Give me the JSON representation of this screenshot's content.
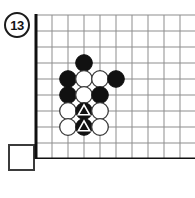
{
  "figure": {
    "kind": "go-board-diagram",
    "label": {
      "text": "13",
      "shape": "circle"
    },
    "answer_box": {
      "text": "",
      "shape": "square",
      "state": "empty"
    }
  },
  "board": {
    "columns": 10,
    "rows": 9,
    "cell_size": 16,
    "edges": [
      "left",
      "bottom"
    ],
    "grid_color": "#8d8d8d",
    "edge_color": "#101010",
    "black_color": "#111111",
    "white_color": "#ffffff",
    "marker_color": "#ffffff"
  },
  "stones": [
    {
      "id": "b1",
      "color": "black",
      "col": 3,
      "row": 3,
      "marker": "none"
    },
    {
      "id": "b2",
      "color": "black",
      "col": 2,
      "row": 4,
      "marker": "none"
    },
    {
      "id": "w1",
      "color": "white",
      "col": 3,
      "row": 4,
      "marker": "none"
    },
    {
      "id": "w2",
      "color": "white",
      "col": 4,
      "row": 4,
      "marker": "none"
    },
    {
      "id": "b3",
      "color": "black",
      "col": 5,
      "row": 4,
      "marker": "none"
    },
    {
      "id": "b4",
      "color": "black",
      "col": 2,
      "row": 5,
      "marker": "none"
    },
    {
      "id": "w3",
      "color": "white",
      "col": 3,
      "row": 5,
      "marker": "none"
    },
    {
      "id": "b5",
      "color": "black",
      "col": 4,
      "row": 5,
      "marker": "none"
    },
    {
      "id": "w4",
      "color": "white",
      "col": 2,
      "row": 6,
      "marker": "none"
    },
    {
      "id": "b6",
      "color": "black",
      "col": 3,
      "row": 6,
      "marker": "triangle"
    },
    {
      "id": "w5",
      "color": "white",
      "col": 4,
      "row": 6,
      "marker": "none"
    },
    {
      "id": "w6",
      "color": "white",
      "col": 2,
      "row": 7,
      "marker": "none"
    },
    {
      "id": "b7",
      "color": "black",
      "col": 3,
      "row": 7,
      "marker": "triangle"
    },
    {
      "id": "w7",
      "color": "white",
      "col": 4,
      "row": 7,
      "marker": "none"
    }
  ]
}
